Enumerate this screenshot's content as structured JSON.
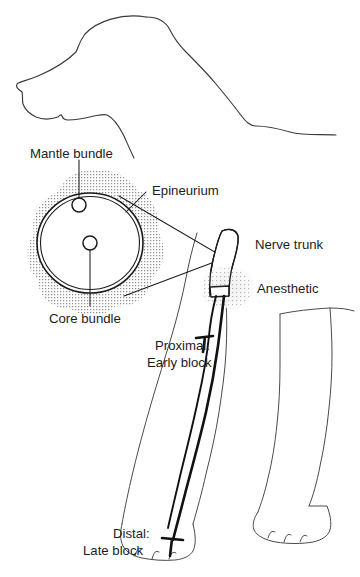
{
  "figure": {
    "width": 360,
    "height": 577,
    "background_color": "#ffffff",
    "ink_color": "#1c1c1c",
    "outline_color": "#3a3a3a",
    "stipple_color": "#9a9a9a"
  },
  "labels": {
    "mantle_bundle": "Mantle bundle",
    "epineurium": "Epineurium",
    "core_bundle": "Core bundle",
    "nerve_trunk": "Nerve trunk",
    "anesthetic": "Anesthetic",
    "proximal_line1": "Proximal:",
    "proximal_line2": "Early block",
    "distal_line1": "Distal:",
    "distal_line2": "Late block"
  },
  "cross_section": {
    "name": "nerve-cross-section",
    "center_x": 90,
    "center_y": 243,
    "radius": 53,
    "mantle_bundle_marker": {
      "cx": 79,
      "cy": 205,
      "r": 7
    },
    "core_bundle_marker": {
      "cx": 90,
      "cy": 243,
      "r": 7
    },
    "stipple_halo": "diffuse anesthetic spread around epineurium"
  },
  "anatomy": {
    "subject": "dog",
    "view": "lateral silhouette",
    "parts": [
      "head",
      "muzzle",
      "neck",
      "dorsal back line",
      "forelimb-near",
      "forelimb-far",
      "paw-near",
      "paw-far"
    ]
  },
  "nerve_path": {
    "injection_site_y": 295,
    "proximal_branch_y": 341,
    "distal_branch_y": 542,
    "description": "Nerve trunk descends the forelimb; anesthetic at injection site blocks mantle fibers first (proximal, early) then core fibers (distal, late)."
  }
}
